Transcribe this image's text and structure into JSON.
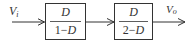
{
  "diagram": {
    "type": "block-diagram",
    "input": {
      "symbol": "V",
      "subscript": "i"
    },
    "output": {
      "symbol": "V",
      "subscript": "o"
    },
    "blocks": [
      {
        "numerator": "D",
        "denominator_prefix": "1−",
        "denominator_var": "D"
      },
      {
        "numerator": "D",
        "denominator_prefix": "2−",
        "denominator_var": "D"
      }
    ],
    "colors": {
      "stroke": "#333333",
      "background": "#ffffff"
    }
  }
}
